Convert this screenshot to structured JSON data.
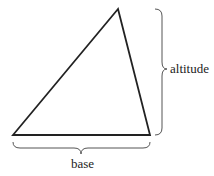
{
  "diagram": {
    "shape": "triangle",
    "labels": {
      "altitude": "altitude",
      "base": "base"
    },
    "colors": {
      "stroke": "#222222",
      "brace": "#555555",
      "background": "#ffffff"
    }
  }
}
